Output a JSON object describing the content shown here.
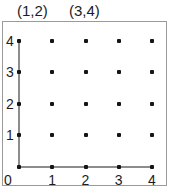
{
  "header": {
    "labels": [
      {
        "text": "(1,2)",
        "name": "coordinate-label-1-2"
      },
      {
        "text": "(3,4)",
        "name": "coordinate-label-3-4"
      }
    ]
  },
  "chart_data": {
    "type": "scatter",
    "title": "",
    "subtitle": "",
    "xlabel": "",
    "ylabel": "",
    "xlim": [
      0,
      4
    ],
    "ylim": [
      0,
      4
    ],
    "grid": false,
    "legend": null,
    "x_ticks": [
      "0",
      "1",
      "2",
      "3",
      "4"
    ],
    "y_ticks": [
      "0",
      "1",
      "2",
      "3",
      "4"
    ],
    "annotations": [
      "(1,2)",
      "(3,4)"
    ],
    "points": [
      {
        "x": 0,
        "y": 0
      },
      {
        "x": 1,
        "y": 0
      },
      {
        "x": 2,
        "y": 0
      },
      {
        "x": 3,
        "y": 0
      },
      {
        "x": 4,
        "y": 0
      },
      {
        "x": 0,
        "y": 1
      },
      {
        "x": 1,
        "y": 1
      },
      {
        "x": 2,
        "y": 1
      },
      {
        "x": 3,
        "y": 1
      },
      {
        "x": 4,
        "y": 1
      },
      {
        "x": 0,
        "y": 2
      },
      {
        "x": 1,
        "y": 2
      },
      {
        "x": 2,
        "y": 2
      },
      {
        "x": 3,
        "y": 2
      },
      {
        "x": 4,
        "y": 2
      },
      {
        "x": 0,
        "y": 3
      },
      {
        "x": 1,
        "y": 3
      },
      {
        "x": 2,
        "y": 3
      },
      {
        "x": 3,
        "y": 3
      },
      {
        "x": 4,
        "y": 3
      },
      {
        "x": 0,
        "y": 4
      },
      {
        "x": 1,
        "y": 4
      },
      {
        "x": 2,
        "y": 4
      },
      {
        "x": 3,
        "y": 4
      },
      {
        "x": 4,
        "y": 4
      }
    ],
    "point_count": 25
  },
  "colors": {
    "dot": "#151515",
    "axis": "#8c8c8c",
    "frame": "#9a9a9a",
    "text": "#1c1c1c",
    "background": "#ffffff"
  },
  "geometry": {
    "origin_px": {
      "x": 19,
      "y": 167
    },
    "step_x_px": 33.25,
    "step_y_px": 31.6
  }
}
